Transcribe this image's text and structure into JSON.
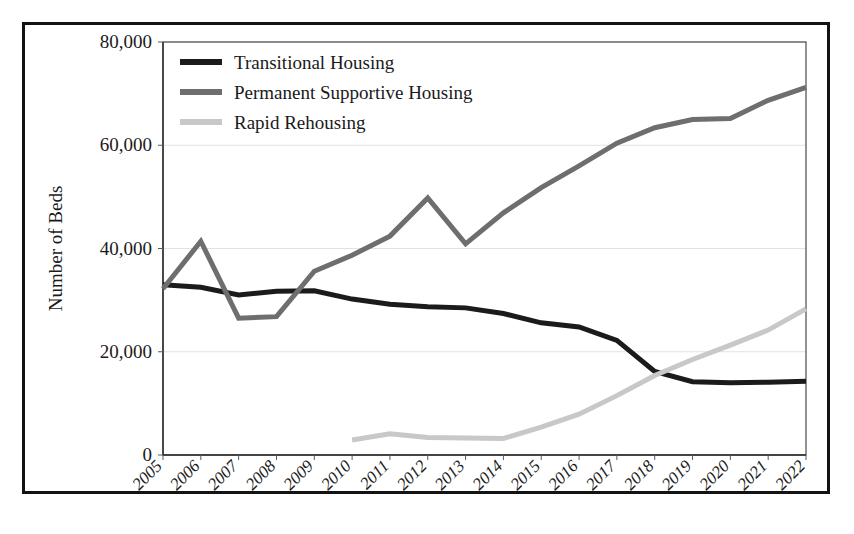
{
  "chart_data": {
    "type": "line",
    "title": "",
    "xlabel": "",
    "ylabel": "Number of Beds",
    "categories": [
      "2005",
      "2006",
      "2007",
      "2008",
      "2009",
      "2010",
      "2011",
      "2012",
      "2013",
      "2014",
      "2015",
      "2016",
      "2017",
      "2018",
      "2019",
      "2020",
      "2021",
      "2022"
    ],
    "x": [
      2005,
      2006,
      2007,
      2008,
      2009,
      2010,
      2011,
      2012,
      2013,
      2014,
      2015,
      2016,
      2017,
      2018,
      2019,
      2020,
      2021,
      2022
    ],
    "ylim": [
      0,
      80000
    ],
    "xlim": [
      2005,
      2022
    ],
    "yticks": [
      0,
      20000,
      40000,
      60000,
      80000
    ],
    "ytick_labels": [
      "0",
      "20,000",
      "40,000",
      "60,000",
      "80,000"
    ],
    "grid": true,
    "grid_axis": "y",
    "legend_position": "top-left",
    "series": [
      {
        "name": "Transitional Housing",
        "color": "#1b1b1b",
        "line_width": 5,
        "values": [
          33000,
          32500,
          31000,
          31700,
          31800,
          30200,
          29200,
          28700,
          28500,
          27400,
          25600,
          24800,
          22200,
          16200,
          14200,
          14000,
          14100,
          14300
        ]
      },
      {
        "name": "Permanent Supportive Housing",
        "color": "#6e6e6e",
        "line_width": 5,
        "values": [
          32200,
          41400,
          26500,
          26800,
          35600,
          38700,
          42400,
          49800,
          40900,
          46900,
          51800,
          56000,
          60400,
          63400,
          65000,
          65200,
          68700,
          71200
        ]
      },
      {
        "name": "Rapid Rehousing",
        "color": "#c8c8c8",
        "line_width": 5,
        "values": [
          null,
          null,
          null,
          null,
          null,
          2900,
          4100,
          3400,
          3300,
          3200,
          5400,
          7900,
          11500,
          15400,
          18500,
          21300,
          24200,
          28300
        ]
      }
    ]
  },
  "legend": {
    "items": [
      {
        "label": "Transitional Housing",
        "color": "#1b1b1b"
      },
      {
        "label": "Permanent Supportive Housing",
        "color": "#6e6e6e"
      },
      {
        "label": "Rapid Rehousing",
        "color": "#c8c8c8"
      }
    ]
  },
  "axes": {
    "y_axis_title": "Number of Beds",
    "y_tick_labels": [
      "80,000",
      "60,000",
      "40,000",
      "20,000",
      "0"
    ],
    "x_tick_labels": [
      "2005",
      "2006",
      "2007",
      "2008",
      "2009",
      "2010",
      "2011",
      "2012",
      "2013",
      "2014",
      "2015",
      "2016",
      "2017",
      "2018",
      "2019",
      "2020",
      "2021",
      "2022"
    ]
  }
}
